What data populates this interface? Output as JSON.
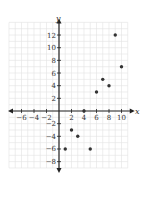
{
  "chart_data": {
    "type": "scatter",
    "title": "",
    "xlabel": "x",
    "ylabel": "y",
    "xlim": [
      -8,
      11
    ],
    "ylim": [
      -9,
      14
    ],
    "grid": true,
    "x_ticks": [
      -6,
      -4,
      -2,
      2,
      4,
      6,
      8,
      10
    ],
    "y_ticks": [
      -8,
      -6,
      -4,
      -2,
      2,
      4,
      6,
      8,
      10,
      12
    ],
    "x_tick_labels": [
      "−6",
      "−4",
      "−2",
      "2",
      "4",
      "6",
      "8",
      "10"
    ],
    "y_tick_labels": [
      "−8",
      "−6",
      "−4",
      "−2",
      "2",
      "4",
      "6",
      "8",
      "10",
      "12"
    ],
    "points": [
      {
        "x": 1,
        "y": -6
      },
      {
        "x": 2,
        "y": -3
      },
      {
        "x": 3,
        "y": -4
      },
      {
        "x": 4,
        "y": 0
      },
      {
        "x": 5,
        "y": -6
      },
      {
        "x": 6,
        "y": 3
      },
      {
        "x": 7,
        "y": 5
      },
      {
        "x": 8,
        "y": 4
      },
      {
        "x": 9,
        "y": 12
      },
      {
        "x": 10,
        "y": 7
      }
    ],
    "colors": {
      "grid": "#e2e2e2",
      "axis": "#222222",
      "point": "#333333"
    }
  }
}
